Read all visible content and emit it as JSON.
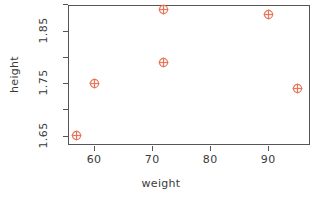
{
  "chart_data": {
    "type": "scatter",
    "title": "",
    "xlabel": "weight",
    "ylabel": "height",
    "xlim": [
      55.5,
      97.2
    ],
    "ylim": [
      1.632,
      1.899
    ],
    "grid": false,
    "legend": false,
    "marker": {
      "shape": "circle-plus",
      "color": "#e8765a",
      "size": 11
    },
    "axis_color": "#555555",
    "x": [
      57,
      60,
      72,
      72,
      90,
      95
    ],
    "y": [
      1.65,
      1.75,
      1.79,
      1.89,
      1.88,
      1.74
    ],
    "points": [
      {
        "weight": 57,
        "height": 1.65
      },
      {
        "weight": 60,
        "height": 1.75
      },
      {
        "weight": 72,
        "height": 1.79
      },
      {
        "weight": 72,
        "height": 1.89
      },
      {
        "weight": 90,
        "height": 1.88
      },
      {
        "weight": 95,
        "height": 1.74
      }
    ],
    "xticks": [
      60,
      70,
      80,
      90
    ],
    "xtick_labels": [
      "60",
      "70",
      "80",
      "90"
    ],
    "yticks": [
      1.65,
      1.7,
      1.75,
      1.8,
      1.85,
      1.9
    ],
    "ytick_labels": [
      "1.65",
      "",
      "1.75",
      "",
      "1.85",
      ""
    ]
  }
}
